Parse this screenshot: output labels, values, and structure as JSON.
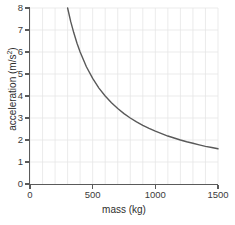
{
  "chart_data": {
    "type": "line",
    "title": "",
    "xlabel": "mass (kg)",
    "ylabel_text": "acceleration (m/s",
    "ylabel_exponent": "2",
    "ylabel_tail": ")",
    "ylabel_full": "acceleration (m/s²)",
    "xlim": [
      0,
      1500
    ],
    "ylim": [
      0,
      8
    ],
    "xticks": [
      0,
      500,
      1000,
      1500
    ],
    "xtick_labels": [
      "0",
      "500",
      "1000",
      "1500"
    ],
    "yticks": [
      0,
      1,
      2,
      3,
      4,
      5,
      6,
      7,
      8
    ],
    "ytick_labels": [
      "0",
      "1",
      "2",
      "3",
      "4",
      "5",
      "6",
      "7",
      "8"
    ],
    "x_minor_step": 100,
    "grid": true,
    "grid_color": "#e6e6e6",
    "legend": "none",
    "series": [
      {
        "name": "acceleration vs mass",
        "relation": "a = 2400 / m",
        "constant": 2400,
        "color": "#595959",
        "line_width": 1.4,
        "x": [
          300,
          325,
          350,
          375,
          400,
          450,
          500,
          550,
          600,
          650,
          700,
          750,
          800,
          850,
          900,
          950,
          1000,
          1050,
          1100,
          1150,
          1200,
          1250,
          1300,
          1350,
          1400,
          1450,
          1500
        ],
        "values": [
          8.0,
          7.38,
          6.86,
          6.4,
          6.0,
          5.33,
          4.8,
          4.36,
          4.0,
          3.69,
          3.43,
          3.2,
          3.0,
          2.82,
          2.67,
          2.53,
          2.4,
          2.29,
          2.18,
          2.09,
          2.0,
          1.92,
          1.85,
          1.78,
          1.71,
          1.66,
          1.6
        ]
      }
    ]
  },
  "style": {
    "axis_color": "#5a5a5a",
    "text_color": "#3b3b3b",
    "background": "#ffffff"
  }
}
